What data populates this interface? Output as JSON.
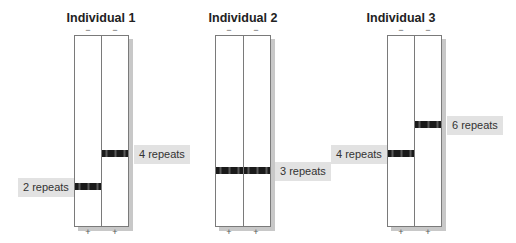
{
  "figure": {
    "individuals": [
      {
        "title": "Individual 1",
        "top_signs": [
          "−",
          "−"
        ],
        "bottom_signs": [
          "+",
          "+"
        ],
        "lanes": [
          {
            "band_label": "2 repeats",
            "band_y": 186,
            "label_side": "left"
          },
          {
            "band_label": "4 repeats",
            "band_y": 153,
            "label_side": "right"
          }
        ]
      },
      {
        "title": "Individual 2",
        "top_signs": [
          "−",
          "−"
        ],
        "bottom_signs": [
          "+",
          "+"
        ],
        "lanes": [
          {
            "band_label": "",
            "band_y": 170,
            "label_side": "none"
          },
          {
            "band_label": "3 repeats",
            "band_y": 170,
            "label_side": "right"
          }
        ]
      },
      {
        "title": "Individual 3",
        "top_signs": [
          "−",
          "−"
        ],
        "bottom_signs": [
          "+",
          "+"
        ],
        "lanes": [
          {
            "band_label": "4 repeats",
            "band_y": 153,
            "label_side": "left"
          },
          {
            "band_label": "6 repeats",
            "band_y": 124,
            "label_side": "right"
          }
        ]
      }
    ],
    "colors": {
      "band": "#1a1a1a",
      "label_bg": "#e2e2e2",
      "gel_border": "#7a7a7a",
      "gel_shadow": "#c8c8c8"
    }
  }
}
